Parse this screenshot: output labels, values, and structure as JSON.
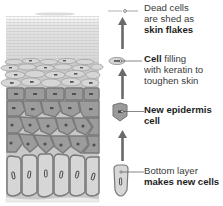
{
  "diagram": {
    "colors": {
      "cell_fill": "#9a9a9a",
      "cell_border": "#6e6e6e",
      "flake_fill": "#e2e2e2",
      "basal_fill": "#d4d4d4",
      "arrow": "#6a6a6a",
      "text": "#3a3a3a"
    },
    "stages": [
      {
        "id": "dead-cells",
        "icon": "dead-cell-flake-icon",
        "lines": [
          {
            "normal": "Dead cells",
            "bold": ""
          },
          {
            "normal": "are shed as",
            "bold": ""
          },
          {
            "normal": "",
            "bold": "skin flakes"
          }
        ]
      },
      {
        "id": "keratin-cell",
        "icon": "flattened-cell-icon",
        "lines": [
          {
            "bold": "Cell",
            "normal": " filling"
          },
          {
            "bold": "",
            "normal": "with keratin to"
          },
          {
            "bold": "",
            "normal": "toughen skin"
          }
        ]
      },
      {
        "id": "new-epidermis-cell",
        "icon": "polygonal-cell-icon",
        "lines": [
          {
            "bold": "New epidermis",
            "normal": ""
          },
          {
            "bold": "cell",
            "normal": ""
          }
        ]
      },
      {
        "id": "bottom-layer",
        "icon": "basal-cell-icon",
        "lines": [
          {
            "bold": "",
            "normal": "Bottom layer"
          },
          {
            "bold": "makes new cells",
            "normal": ""
          }
        ]
      }
    ],
    "arrows": [
      {
        "from": "bottom-layer",
        "to": "new-epidermis-cell",
        "direction": "up"
      },
      {
        "from": "new-epidermis-cell",
        "to": "keratin-cell",
        "direction": "up"
      },
      {
        "from": "keratin-cell",
        "to": "dead-cells",
        "direction": "up"
      }
    ]
  }
}
